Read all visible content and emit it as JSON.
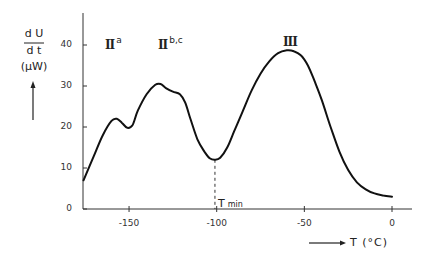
{
  "chart_data": {
    "type": "line",
    "title": "",
    "xlabel": "T (°C)",
    "ylabel": "dU/dt (μW)",
    "ylabel_parts": {
      "numerator": "d U",
      "denominator": "d t",
      "unit": "(μW)"
    },
    "xlim": [
      -176,
      10
    ],
    "ylim": [
      0,
      45
    ],
    "x_ticks": [
      -150,
      -100,
      -50,
      0
    ],
    "x_tick_labels": [
      "-150",
      "-100",
      "-50",
      "0"
    ],
    "y_ticks": [
      0,
      10,
      20,
      30,
      40
    ],
    "y_tick_labels": [
      "0",
      "10",
      "20",
      "30",
      "40"
    ],
    "grid": false,
    "legend": null,
    "series": [
      {
        "name": "dU/dt",
        "x": [
          -176,
          -170,
          -165,
          -160,
          -157,
          -154,
          -151,
          -148,
          -145,
          -140,
          -135,
          -132,
          -129,
          -125,
          -121,
          -118,
          -115,
          -111,
          -107,
          -104,
          -101,
          -98,
          -94,
          -90,
          -85,
          -80,
          -75,
          -70,
          -65,
          -60,
          -56,
          -52,
          -48,
          -44,
          -40,
          -35,
          -30,
          -25,
          -20,
          -15,
          -10,
          -5,
          0
        ],
        "y": [
          7,
          13,
          18,
          21.5,
          22,
          21,
          19.8,
          20.5,
          24,
          28,
          30.3,
          30.5,
          29.5,
          28.6,
          28,
          26,
          22,
          17,
          14,
          12.4,
          12,
          12.5,
          15,
          19,
          24,
          29,
          33,
          36,
          38,
          38.7,
          38.5,
          37.5,
          35,
          31,
          26.5,
          20,
          14,
          9.5,
          6.5,
          4.8,
          3.8,
          3.3,
          3
        ]
      }
    ],
    "annotations": [
      {
        "text": "II",
        "superscript": "a",
        "x": -157,
        "y": 40
      },
      {
        "text": "II",
        "superscript": "b,c",
        "x": -133,
        "y": 40
      },
      {
        "text": "III",
        "x": -57,
        "y": 41
      },
      {
        "text": "T",
        "subscript": "min",
        "x": -101,
        "y": 2,
        "marker": "dashed vertical line at T ≈ -101 from curve minimum (≈12) to axis"
      }
    ]
  },
  "labels": {
    "y_num": "d U",
    "y_den": "d t",
    "y_unit": "(μW)",
    "x_axis": "T (°C)",
    "peak_IIa": "II",
    "peak_IIa_sup": "a",
    "peak_IIbc": "II",
    "peak_IIbc_sup": "b,c",
    "peak_III": "III",
    "tmin": "T",
    "tmin_sub": "min"
  }
}
